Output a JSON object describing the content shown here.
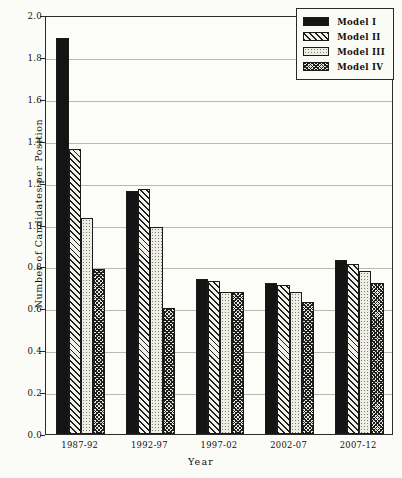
{
  "chart_data": {
    "type": "bar",
    "title": "",
    "xlabel": "Year",
    "ylabel": "Number of Candidates per Position",
    "categories": [
      "1987-92",
      "1992-97",
      "1997-02",
      "2002-07",
      "2007-12"
    ],
    "ylim": [
      0.0,
      2.0
    ],
    "yticks": [
      "0.0",
      "0.2",
      "0.4",
      "0.6",
      "0.8",
      "1.0",
      "1.2",
      "1.4",
      "1.6",
      "1.8",
      "2.0"
    ],
    "ytick_values": [
      0.0,
      0.2,
      0.4,
      0.6,
      0.8,
      1.0,
      1.2,
      1.4,
      1.6,
      1.8,
      2.0
    ],
    "grid": true,
    "legend_position": "top-right",
    "series": [
      {
        "name": "Model I",
        "pattern": "solid-black",
        "values": [
          1.89,
          1.16,
          0.74,
          0.72,
          0.83
        ]
      },
      {
        "name": "Model II",
        "pattern": "diagonal-hatch",
        "values": [
          1.36,
          1.17,
          0.73,
          0.71,
          0.81
        ]
      },
      {
        "name": "Model III",
        "pattern": "light-dots",
        "values": [
          1.03,
          0.99,
          0.68,
          0.68,
          0.78
        ]
      },
      {
        "name": "Model IV",
        "pattern": "dense-crosshatch",
        "values": [
          0.79,
          0.6,
          0.68,
          0.63,
          0.72
        ]
      }
    ]
  },
  "colors": {
    "axis": "#2a2a2a",
    "grid": "#b9b9ae",
    "background": "#fbfbf7",
    "plot_background": "#fcfcf8",
    "model_1": "#141414",
    "model_2": "#f2f2ea",
    "model_3": "#eeeee4",
    "model_4": "#e8e8de"
  }
}
